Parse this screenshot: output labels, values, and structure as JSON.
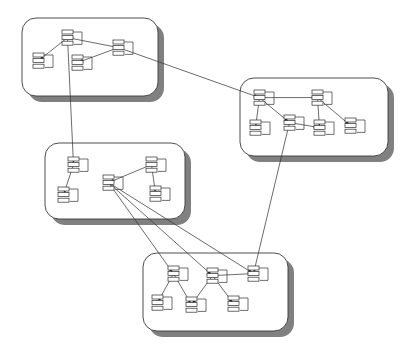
{
  "diagram": {
    "type": "node-link-diagram",
    "canvas": {
      "width": 409,
      "height": 356,
      "background": "#ffffff"
    },
    "style": {
      "cluster_fill": "#ffffff",
      "cluster_stroke": "#3a3a3a",
      "cluster_shadow": "#808080",
      "node_fill": "#ffffff",
      "node_stroke": "#3a3a3a",
      "edge_stroke": "#3a3a3a",
      "arrowhead_fill": "#1a1a1a",
      "cluster_corner_radius": 14,
      "shadow_offset_x": 6,
      "shadow_offset_y": 6
    },
    "clusters": [
      {
        "id": "cluster-top-left",
        "label": "top-left-cluster",
        "x": 22,
        "y": 18,
        "width": 136,
        "height": 78,
        "nodes": [
          {
            "id": "tl-root",
            "x": 62,
            "y": 30,
            "cells": 3,
            "label": "tl-root-node"
          },
          {
            "id": "tl-left",
            "x": 33,
            "y": 53,
            "cells": 3,
            "label": "tl-left-node"
          },
          {
            "id": "tl-mid",
            "x": 72,
            "y": 55,
            "cells": 3,
            "label": "tl-mid-node"
          },
          {
            "id": "tl-right",
            "x": 113,
            "y": 40,
            "cells": 3,
            "label": "tl-right-node"
          }
        ],
        "edges": [
          {
            "from": "tl-root",
            "to": "tl-left"
          },
          {
            "from": "tl-right",
            "to": "tl-root"
          },
          {
            "from": "tl-right",
            "to": "tl-mid"
          }
        ]
      },
      {
        "id": "cluster-top-right",
        "label": "top-right-cluster",
        "x": 240,
        "y": 78,
        "width": 148,
        "height": 78,
        "nodes": [
          {
            "id": "tr-root",
            "x": 254,
            "y": 90,
            "cells": 3,
            "label": "tr-root-node"
          },
          {
            "id": "tr-c1",
            "x": 250,
            "y": 120,
            "cells": 3,
            "label": "tr-child-1"
          },
          {
            "id": "tr-c2",
            "x": 284,
            "y": 115,
            "cells": 3,
            "label": "tr-child-2"
          },
          {
            "id": "tr-c3",
            "x": 314,
            "y": 120,
            "cells": 3,
            "label": "tr-child-3"
          },
          {
            "id": "tr-top2",
            "x": 312,
            "y": 90,
            "cells": 3,
            "label": "tr-second-root"
          },
          {
            "id": "tr-c4",
            "x": 345,
            "y": 118,
            "cells": 3,
            "label": "tr-child-4"
          }
        ],
        "edges": [
          {
            "from": "tr-root",
            "to": "tr-c1"
          },
          {
            "from": "tr-root",
            "to": "tr-c2"
          },
          {
            "from": "tr-root",
            "to": "tr-top2"
          },
          {
            "from": "tr-top2",
            "to": "tr-c3"
          },
          {
            "from": "tr-top2",
            "to": "tr-c4"
          },
          {
            "from": "tr-c2",
            "to": "tr-c3"
          }
        ]
      },
      {
        "id": "cluster-mid-left",
        "label": "middle-left-cluster",
        "x": 45,
        "y": 143,
        "width": 140,
        "height": 76,
        "nodes": [
          {
            "id": "ml-root",
            "x": 68,
            "y": 157,
            "cells": 3,
            "label": "ml-root-node"
          },
          {
            "id": "ml-left",
            "x": 58,
            "y": 187,
            "cells": 3,
            "label": "ml-left-node"
          },
          {
            "id": "ml-mid",
            "x": 103,
            "y": 175,
            "cells": 3,
            "label": "ml-mid-node"
          },
          {
            "id": "ml-top",
            "x": 146,
            "y": 157,
            "cells": 3,
            "label": "ml-top-node"
          },
          {
            "id": "ml-right",
            "x": 150,
            "y": 186,
            "cells": 3,
            "label": "ml-right-node"
          }
        ],
        "edges": [
          {
            "from": "ml-root",
            "to": "ml-left"
          },
          {
            "from": "ml-top",
            "to": "ml-mid"
          },
          {
            "from": "ml-top",
            "to": "ml-right"
          }
        ]
      },
      {
        "id": "cluster-bottom",
        "label": "bottom-cluster",
        "x": 143,
        "y": 253,
        "width": 145,
        "height": 78,
        "nodes": [
          {
            "id": "bt-a",
            "x": 168,
            "y": 266,
            "cells": 3,
            "label": "bottom-node-a"
          },
          {
            "id": "bt-b",
            "x": 207,
            "y": 268,
            "cells": 3,
            "label": "bottom-node-b"
          },
          {
            "id": "bt-c",
            "x": 248,
            "y": 266,
            "cells": 3,
            "label": "bottom-node-c"
          },
          {
            "id": "bt-d",
            "x": 152,
            "y": 295,
            "cells": 3,
            "label": "bottom-node-d"
          },
          {
            "id": "bt-e",
            "x": 186,
            "y": 297,
            "cells": 3,
            "label": "bottom-node-e"
          },
          {
            "id": "bt-f",
            "x": 228,
            "y": 296,
            "cells": 3,
            "label": "bottom-node-f"
          }
        ],
        "edges": [
          {
            "from": "bt-a",
            "to": "bt-d"
          },
          {
            "from": "bt-a",
            "to": "bt-e"
          },
          {
            "from": "bt-b",
            "to": "bt-e"
          },
          {
            "from": "bt-b",
            "to": "bt-f"
          },
          {
            "from": "bt-b",
            "to": "bt-c"
          }
        ]
      }
    ],
    "inter_cluster_edges": [
      {
        "id": "e1",
        "from": "tl-right",
        "to": "tr-root",
        "label": "top-left-to-top-right"
      },
      {
        "id": "e2",
        "from": "tl-root",
        "to": "ml-root",
        "label": "top-left-to-middle-left"
      },
      {
        "id": "e3",
        "from": "tr-c2",
        "to": "bt-c",
        "label": "top-right-to-bottom"
      },
      {
        "id": "e4",
        "from": "ml-mid",
        "to": "bt-a",
        "label": "middle-left-to-bottom-a"
      },
      {
        "id": "e5",
        "from": "ml-mid",
        "to": "bt-b",
        "label": "middle-left-to-bottom-b"
      },
      {
        "id": "e6",
        "from": "ml-mid",
        "to": "bt-c",
        "label": "middle-left-to-bottom-c"
      }
    ]
  }
}
